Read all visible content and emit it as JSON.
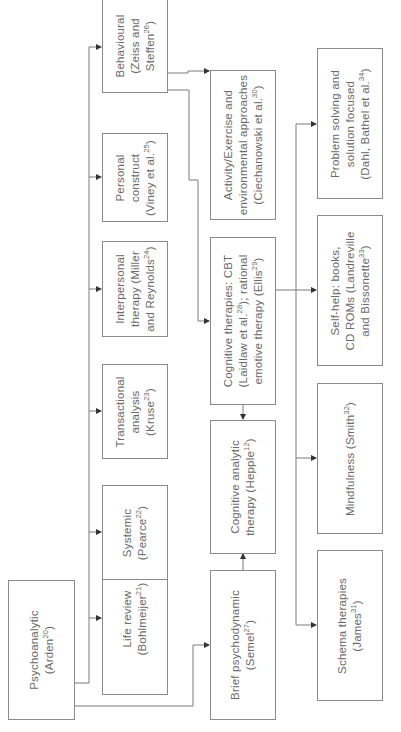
{
  "diagram": {
    "orientation": "rotated-90-ccw",
    "line_color": "#7a7a7a",
    "nodes": [
      {
        "id": "psychoanalytic",
        "lines": [
          {
            "t": "Psychoanalytic"
          },
          {
            "t": "(Arden",
            "sup": "20",
            "end": ")"
          }
        ]
      },
      {
        "id": "life-review",
        "lines": [
          {
            "t": "Life review"
          },
          {
            "t": "(Bohlmeijer",
            "sup": "21",
            "end": ")"
          }
        ]
      },
      {
        "id": "systemic",
        "lines": [
          {
            "t": "Systemic"
          },
          {
            "t": "(Pearce",
            "sup": "22",
            "end": ")"
          }
        ]
      },
      {
        "id": "transactional",
        "lines": [
          {
            "t": "Transactional"
          },
          {
            "t": "analysis"
          },
          {
            "t": "(Kruse",
            "sup": "23",
            "end": ")"
          }
        ]
      },
      {
        "id": "interpersonal",
        "lines": [
          {
            "t": "Interpersonal"
          },
          {
            "t": "therapy (Miller"
          },
          {
            "t": "and Reynolds",
            "sup": "24",
            "end": ")"
          }
        ]
      },
      {
        "id": "personal-construct",
        "lines": [
          {
            "t": "Personal"
          },
          {
            "t": "construct"
          },
          {
            "t": "(Viney et al.",
            "sup": "25",
            "end": ")"
          }
        ]
      },
      {
        "id": "behavioural",
        "lines": [
          {
            "t": "Behavioural"
          },
          {
            "t": "(Zeiss and"
          },
          {
            "t": "Steffen",
            "sup": "26",
            "end": ")"
          }
        ]
      },
      {
        "id": "brief-psychodynamic",
        "lines": [
          {
            "t": "Brief psychodynamic"
          },
          {
            "t": "(Semel",
            "sup": "27",
            "end": ")"
          }
        ]
      },
      {
        "id": "cognitive-analytic",
        "lines": [
          {
            "t": "Cognitive analytic"
          },
          {
            "t": "therapy (Hepple",
            "sup": "12",
            "end": ")"
          }
        ]
      },
      {
        "id": "cognitive-therapies",
        "lines": [
          {
            "t": "Cognitive therapies: CBT"
          },
          {
            "t": "(Laidlaw et al.",
            "sup": "28",
            "end": "); rational"
          },
          {
            "t": "emotive therapy (Ellis",
            "sup": "29",
            "end": ")"
          }
        ]
      },
      {
        "id": "activity-exercise",
        "lines": [
          {
            "t": "Activity/Exercise and"
          },
          {
            "t": "environmental approaches"
          },
          {
            "t": "(Ciechanowski et al.",
            "sup": "30",
            "end": ")"
          }
        ]
      },
      {
        "id": "problem-solving",
        "lines": [
          {
            "t": "Problem solving and"
          },
          {
            "t": "solution focused"
          },
          {
            "t": "(Dahl, Bathel et al.",
            "sup": "34",
            "end": ")"
          }
        ]
      },
      {
        "id": "self-help",
        "lines": [
          {
            "t": "Self-help: books,"
          },
          {
            "t": "CD ROMs (Landreville"
          },
          {
            "t": "and Bissonette",
            "sup": "33",
            "end": ")"
          }
        ]
      },
      {
        "id": "mindfulness",
        "lines": [
          {
            "t": "Mindfulness (Smith",
            "sup": "32",
            "end": ")"
          }
        ]
      },
      {
        "id": "schema",
        "lines": [
          {
            "t": "Schema therapies"
          },
          {
            "t": "(James",
            "sup": "31",
            "end": ")"
          }
        ]
      }
    ],
    "edges": [
      [
        "psychoanalytic",
        "life-review"
      ],
      [
        "psychoanalytic",
        "systemic"
      ],
      [
        "psychoanalytic",
        "transactional"
      ],
      [
        "psychoanalytic",
        "interpersonal"
      ],
      [
        "psychoanalytic",
        "personal-construct"
      ],
      [
        "psychoanalytic",
        "behavioural"
      ],
      [
        "psychoanalytic",
        "brief-psychodynamic"
      ],
      [
        "brief-psychodynamic",
        "cognitive-analytic"
      ],
      [
        "behavioural",
        "activity-exercise"
      ],
      [
        "behavioural",
        "cognitive-therapies"
      ],
      [
        "cognitive-therapies",
        "cognitive-analytic"
      ],
      [
        "cognitive-therapies",
        "problem-solving"
      ],
      [
        "cognitive-therapies",
        "self-help"
      ],
      [
        "cognitive-therapies",
        "mindfulness"
      ],
      [
        "cognitive-therapies",
        "schema"
      ]
    ]
  }
}
